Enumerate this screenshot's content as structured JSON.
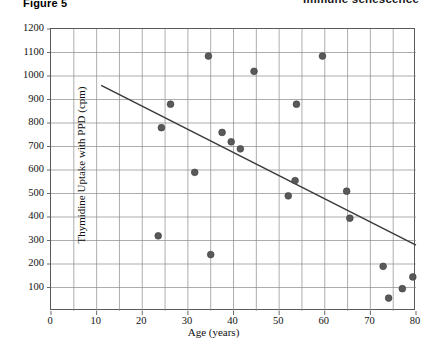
{
  "header": {
    "figure_label": "Figure 5",
    "running_head": "Immune senescence"
  },
  "chart_data": {
    "type": "scatter",
    "title": "",
    "xlabel": "Age (years)",
    "ylabel": "Thymidine Uptake with PPD (cpm)",
    "xlim": [
      0,
      80
    ],
    "ylim": [
      0,
      1200
    ],
    "x_major_step": 10,
    "x_minor_step": 5,
    "y_major_step": 100,
    "grid": true,
    "grid_color": "#8a8a8a",
    "frame_color": "#5a5a5a",
    "marker_color": "#595959",
    "marker_radius": 3.4,
    "legend": "none",
    "xticks": [
      0,
      10,
      20,
      30,
      40,
      50,
      60,
      70,
      80
    ],
    "xticklabels": [
      "0",
      "10",
      "20",
      "30",
      "40",
      "50",
      "60",
      "70",
      "80"
    ],
    "yticks": [
      100,
      200,
      300,
      400,
      500,
      600,
      700,
      800,
      900,
      1000,
      1100,
      1200
    ],
    "yticklabels": [
      "100",
      "200",
      "300",
      "400",
      "500",
      "600",
      "700",
      "800",
      "900",
      "1000",
      "1100",
      "1200"
    ],
    "points": [
      {
        "x": 23.5,
        "y": 320
      },
      {
        "x": 24.2,
        "y": 780
      },
      {
        "x": 26.2,
        "y": 880
      },
      {
        "x": 31.5,
        "y": 590
      },
      {
        "x": 34.5,
        "y": 1085
      },
      {
        "x": 35.0,
        "y": 240
      },
      {
        "x": 37.5,
        "y": 760
      },
      {
        "x": 39.5,
        "y": 720
      },
      {
        "x": 41.5,
        "y": 690
      },
      {
        "x": 44.5,
        "y": 1020
      },
      {
        "x": 52.0,
        "y": 490
      },
      {
        "x": 53.5,
        "y": 555
      },
      {
        "x": 53.8,
        "y": 880
      },
      {
        "x": 59.5,
        "y": 1085
      },
      {
        "x": 64.8,
        "y": 510
      },
      {
        "x": 65.5,
        "y": 395
      },
      {
        "x": 72.8,
        "y": 190
      },
      {
        "x": 74.0,
        "y": 55
      },
      {
        "x": 77.0,
        "y": 95
      },
      {
        "x": 79.3,
        "y": 145
      }
    ],
    "trend_line": {
      "label": "linear regression",
      "color": "#3a3a3a",
      "x_start": 11.0,
      "y_start": 960,
      "x_end": 80.0,
      "y_end": 280
    }
  }
}
